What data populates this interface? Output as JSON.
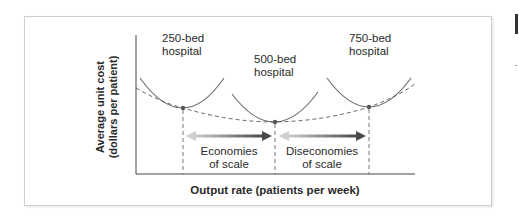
{
  "diagram": {
    "y_axis_label_line1": "Average unit cost",
    "y_axis_label_line2": "(dollars per patient)",
    "x_axis_label": "Output rate (patients per week)",
    "curves": [
      {
        "label_line1": "250-bed",
        "label_line2": "hospital"
      },
      {
        "label_line1": "500-bed",
        "label_line2": "hospital"
      },
      {
        "label_line1": "750-bed",
        "label_line2": "hospital"
      }
    ],
    "regions": [
      {
        "label_line1": "Economies",
        "label_line2": "of scale"
      },
      {
        "label_line1": "Diseconomies",
        "label_line2": "of scale"
      }
    ],
    "colors": {
      "curve": "#6b6b6b",
      "envelope": "#555555",
      "arrow_dark": "#555555",
      "arrow_light": "#c8c8c8",
      "point": "#555555"
    }
  }
}
